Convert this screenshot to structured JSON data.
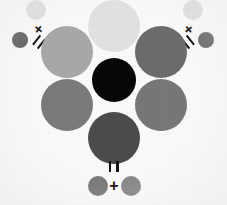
{
  "diagram": {
    "background_color": "#fbfbfb",
    "width": 227,
    "height": 205
  },
  "primary_circles": [
    {
      "name": "top-left-primary",
      "label": "light gray",
      "color": "#a9a9a9",
      "cx": 67,
      "cy": 52,
      "r": 26
    },
    {
      "name": "top-center-primary",
      "label": "lightest gray",
      "color": "#e3e3e3",
      "cx": 114,
      "cy": 26,
      "r": 26
    },
    {
      "name": "top-right-primary",
      "label": "dark gray",
      "color": "#6d6d6d",
      "cx": 161,
      "cy": 52,
      "r": 26
    },
    {
      "name": "bottom-left-primary",
      "label": "medium gray",
      "color": "#7b7b7b",
      "cx": 67,
      "cy": 105,
      "r": 26
    },
    {
      "name": "bottom-right-primary",
      "label": "medium gray",
      "color": "#787878",
      "cx": 161,
      "cy": 105,
      "r": 26
    },
    {
      "name": "bottom-center-result",
      "label": "darkest gray",
      "color": "#4c4c4c",
      "cx": 114,
      "cy": 138,
      "r": 26
    }
  ],
  "center_circle": {
    "name": "center-black",
    "label": "black",
    "color": "#080808",
    "cx": 114,
    "cy": 80,
    "r": 22
  },
  "equations": [
    {
      "name": "equation-left",
      "operand_small": {
        "color": "#636363",
        "cx": 20,
        "cy": 40,
        "r": 8
      },
      "operand_light": {
        "color": "#e0e0e0",
        "cx": 36,
        "cy": 10,
        "r": 10
      },
      "plus_symbol": "+",
      "equals_symbol": "=",
      "plus_rotation_deg": -52,
      "equals_rotation_deg": -52,
      "result_ref": "top-left-primary"
    },
    {
      "name": "equation-right",
      "operand_small": {
        "color": "#6f6f6f",
        "cx": 206,
        "cy": 40,
        "r": 8
      },
      "operand_light": {
        "color": "#e0e0e0",
        "cx": 193,
        "cy": 10,
        "r": 10
      },
      "plus_symbol": "+",
      "equals_symbol": "=",
      "plus_rotation_deg": 52,
      "equals_rotation_deg": 52,
      "result_ref": "top-right-primary"
    },
    {
      "name": "equation-bottom",
      "operand_left": {
        "color": "#7a7a7a",
        "cx": 98,
        "cy": 186,
        "r": 10
      },
      "operand_right": {
        "color": "#8a8a8a",
        "cx": 131,
        "cy": 186,
        "r": 10
      },
      "plus_symbol": "+",
      "equals_symbol": "=",
      "plus_rotation_deg": 0,
      "equals_rotation_deg": 90,
      "result_ref": "bottom-center-result"
    }
  ],
  "symbols": {
    "plus": "+",
    "equals": "="
  }
}
